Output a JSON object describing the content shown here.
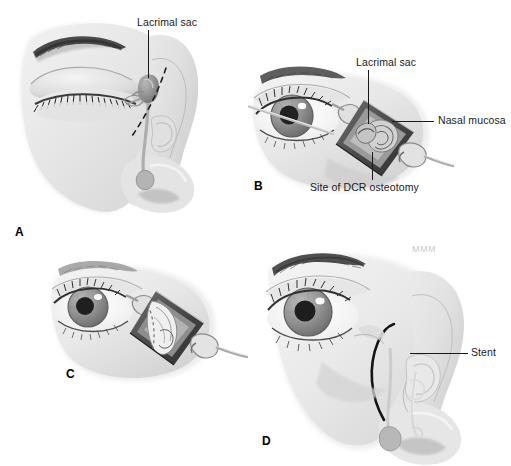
{
  "figure": {
    "background_color": "#ffffff",
    "width": 511,
    "height": 466,
    "signature": "MMM",
    "line_color": "#1a1a1a",
    "tissue_color": "#e8e8e8",
    "shadow_color": "#9a9a9a",
    "iris_color": "#8e8e8e",
    "pupil_color": "#262626"
  },
  "panels": [
    {
      "letter": "A",
      "name": "panel-a-preoperative-anatomy",
      "caption_position": "bottom-left",
      "labels": [
        {
          "text": "Lacrimal sac",
          "name": "label-lacrimal-sac-a"
        }
      ]
    },
    {
      "letter": "B",
      "name": "panel-b-osteotomy-exposure",
      "caption_position": "bottom-left",
      "labels": [
        {
          "text": "Lacrimal sac",
          "name": "label-lacrimal-sac-b"
        },
        {
          "text": "Nasal mucosa",
          "name": "label-nasal-mucosa"
        },
        {
          "text": "Site of DCR osteotomy",
          "name": "label-site-of-dcr-osteotomy"
        }
      ]
    },
    {
      "letter": "C",
      "name": "panel-c-anastomosis",
      "caption_position": "bottom-left",
      "labels": []
    },
    {
      "letter": "D",
      "name": "panel-d-stent-placement",
      "caption_position": "bottom-center",
      "labels": [
        {
          "text": "Stent",
          "name": "label-stent"
        }
      ]
    }
  ]
}
